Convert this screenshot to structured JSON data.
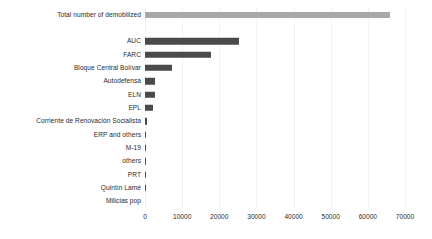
{
  "chart_data": {
    "type": "bar",
    "orientation": "horizontal",
    "title": "",
    "xlabel": "",
    "ylabel": "",
    "xlim": [
      0,
      70000
    ],
    "grid": true,
    "legend": false,
    "xticks": [
      0,
      10000,
      20000,
      30000,
      40000,
      50000,
      60000,
      70000
    ],
    "xtick_labels": [
      "0",
      "10000",
      "20000",
      "30000",
      "40000",
      "50000",
      "60000",
      "70000"
    ],
    "categories": [
      "Total number of demobilized",
      "",
      "AUC",
      "FARC",
      "Bloque Central Bolívar",
      "Autodefensa",
      "ELN",
      "EPL",
      "Corriente de Renovación Socialista",
      "ERP and others",
      "M-19",
      "others",
      "PRT",
      "Quintín Lamé",
      "Milicias pop"
    ],
    "values": [
      66000,
      null,
      25300,
      17800,
      7300,
      2700,
      2600,
      2200,
      600,
      400,
      300,
      250,
      150,
      100,
      0
    ],
    "bar_kinds": [
      "total",
      "spacer",
      "cat",
      "cat",
      "cat",
      "cat",
      "cat",
      "cat",
      "cat",
      "cat",
      "cat",
      "cat",
      "cat",
      "cat",
      "cat"
    ],
    "colors": {
      "total_bar": "#a8a8a8",
      "category_bar": "#4a4a4a",
      "gridline": "#f2f2f2",
      "text": "#2b2b2b",
      "background": "#ffffff"
    }
  }
}
